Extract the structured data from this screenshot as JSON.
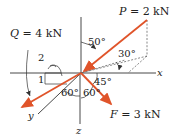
{
  "figure": {
    "type": "3D force diagram",
    "colors": {
      "force_arrow": "#e0542a",
      "axis": "#333333",
      "dashed_construction": "#555555",
      "text": "#222222"
    },
    "axes": {
      "x_label": "x",
      "y_label": "y",
      "z_label": "z"
    },
    "forces": {
      "P": {
        "label": "P = 2 kN",
        "symbol": "P",
        "magnitude": "2 kN"
      },
      "Q": {
        "label": "Q = 4 kN",
        "symbol": "Q",
        "magnitude": "4 kN"
      },
      "F": {
        "label": "F = 3 kN",
        "symbol": "F",
        "magnitude": "3 kN"
      }
    },
    "angles": {
      "a50": "50°",
      "a30": "30°",
      "a45": "45°",
      "a60_left": "60°",
      "a60_right": "60°"
    },
    "slope": {
      "rise": "1",
      "run": "2"
    }
  }
}
